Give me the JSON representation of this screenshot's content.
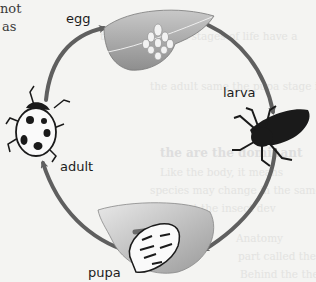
{
  "page_fragment": {
    "line1": "not",
    "line2": "as"
  },
  "bleed_through": {
    "lines": [
      "the first through stages of life have a",
      "the adult same the pupa stage is a",
      "the are the dominant",
      "Like the body, it means",
      "species may change in the same way of",
      "the bet the insect dev",
      "Anatomy",
      "part called the",
      "Behind the the"
    ]
  },
  "diagram": {
    "stages": [
      {
        "id": "egg",
        "label": "egg"
      },
      {
        "id": "larva",
        "label": "larva"
      },
      {
        "id": "pupa",
        "label": "pupa"
      },
      {
        "id": "adult",
        "label": "adult"
      }
    ],
    "colors": {
      "arrow": "#5f5f5f",
      "leaf": "#a9a9a9",
      "leaf_light": "#d8d8d8",
      "insect": "#1a1a1a",
      "background": "#f4f4f2"
    }
  }
}
